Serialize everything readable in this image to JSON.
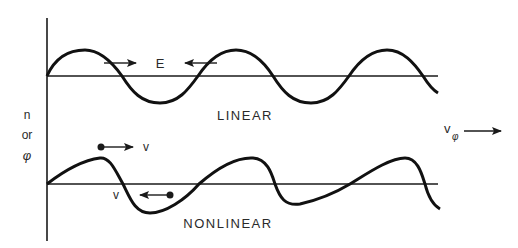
{
  "diagram": {
    "y_axis_label": {
      "line1": "n",
      "line2": "or",
      "line3": "φ"
    },
    "linear_panel": {
      "label": "LINEAR",
      "field_label": "E"
    },
    "nonlinear_panel": {
      "label": "NONLINEAR",
      "velocity_label_forward": "v",
      "velocity_label_backward": "v"
    },
    "phase_velocity": {
      "symbol": "v",
      "subscript": "φ"
    },
    "colors": {
      "ink": "#1a1a1a",
      "background": "#ffffff"
    }
  }
}
